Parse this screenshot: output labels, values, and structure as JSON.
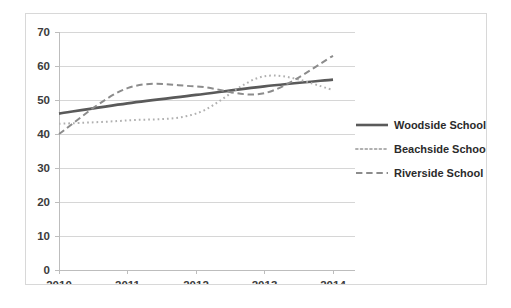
{
  "chart_data": {
    "type": "line",
    "title": "",
    "subtitle": "",
    "xlabel": "",
    "ylabel": "",
    "x": [
      2010,
      2011,
      2012,
      2013,
      2014
    ],
    "categories": [
      "2010",
      "2011",
      "2012",
      "2013",
      "2014"
    ],
    "xtick_labels": [
      "2010",
      "2011",
      "2012",
      "2013",
      "2014"
    ],
    "ytick_labels": [
      "0",
      "10",
      "20",
      "30",
      "40",
      "50",
      "60",
      "70"
    ],
    "ytick_values": [
      0,
      10,
      20,
      30,
      40,
      50,
      60,
      70
    ],
    "ylim": [
      0,
      70
    ],
    "xlim": [
      2010,
      2014
    ],
    "grid": "horizontal",
    "legend_position": "right",
    "series": [
      {
        "name": "Woodside School",
        "values": [
          46,
          49,
          51.5,
          54,
          56
        ],
        "style": "solid",
        "color": "#5a5a5a",
        "width": 2.6
      },
      {
        "name": "Beachside School",
        "values": [
          43,
          44,
          46,
          57,
          53
        ],
        "style": "dotted",
        "color": "#b0b0b0",
        "width": 2.0
      },
      {
        "name": "Riverside School",
        "values": [
          40,
          53.5,
          54,
          52,
          63
        ],
        "style": "dashed",
        "color": "#8c8c8c",
        "width": 2.0
      }
    ]
  },
  "legend": {
    "items": [
      {
        "label": "Woodside School",
        "swatch": "solid-line-swatch"
      },
      {
        "label": "Beachside School",
        "swatch": "dotted-line-swatch"
      },
      {
        "label": "Riverside School",
        "swatch": "dashed-line-swatch"
      }
    ]
  },
  "colors": {
    "frame_border": "#d8d8d8",
    "gridline": "#d6d6d6",
    "axis": "#bdbdbd",
    "text": "#3c3c3c",
    "background": "#ffffff"
  }
}
